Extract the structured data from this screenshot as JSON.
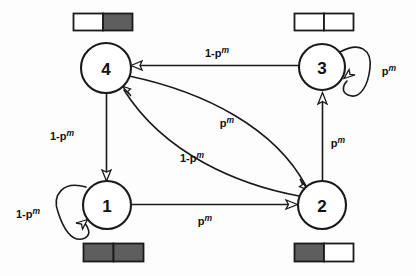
{
  "figure": {
    "background_color": "#fdfdfd",
    "ink_color": "#1a1a1a",
    "cell_fill_dark": "#5e5e5e",
    "cell_fill_light": "#ffffff"
  },
  "nodes": [
    {
      "id": "node-4",
      "label": "4",
      "cx": 106,
      "cy": 68,
      "r": 25
    },
    {
      "id": "node-3",
      "label": "3",
      "cx": 322,
      "cy": 67,
      "r": 23
    },
    {
      "id": "node-1",
      "label": "1",
      "cx": 107,
      "cy": 205,
      "r": 24
    },
    {
      "id": "node-2",
      "label": "2",
      "cx": 322,
      "cy": 205,
      "r": 24
    }
  ],
  "registers": [
    {
      "id": "register-node-4",
      "owner": "4",
      "position": "above",
      "x": 73,
      "y": 13,
      "w": 59,
      "h": 18,
      "cells": [
        "white",
        "dark"
      ]
    },
    {
      "id": "register-node-3",
      "owner": "3",
      "position": "above",
      "x": 294,
      "y": 13,
      "w": 59,
      "h": 18,
      "cells": [
        "white",
        "white"
      ]
    },
    {
      "id": "register-node-1",
      "owner": "1",
      "position": "below",
      "x": 83,
      "y": 243,
      "w": 60,
      "h": 19,
      "cells": [
        "dark",
        "dark"
      ]
    },
    {
      "id": "register-node-2",
      "owner": "2",
      "position": "below",
      "x": 294,
      "y": 243,
      "w": 59,
      "h": 19,
      "cells": [
        "dark",
        "white"
      ]
    }
  ],
  "edges": [
    {
      "id": "edge-3-to-4",
      "from": "3",
      "to": "4",
      "label_base": "1-p",
      "label_sup": "m",
      "label_x": 217,
      "label_y": 57,
      "kind": "straight"
    },
    {
      "id": "edge-4-to-2",
      "from": "4",
      "to": "2",
      "label_base": "p",
      "label_sup": "m",
      "label_x": 227,
      "label_y": 127,
      "kind": "curve"
    },
    {
      "id": "edge-2-to-4",
      "from": "2",
      "to": "4",
      "label_base": "1-p",
      "label_sup": "m",
      "label_x": 192,
      "label_y": 162,
      "kind": "curve"
    },
    {
      "id": "edge-4-to-1",
      "from": "4",
      "to": "1",
      "label_base": "1-p",
      "label_sup": "m",
      "label_x": 62,
      "label_y": 140,
      "kind": "straight"
    },
    {
      "id": "edge-1-to-2",
      "from": "1",
      "to": "2",
      "label_base": "p",
      "label_sup": "m",
      "label_x": 205,
      "label_y": 225,
      "kind": "straight"
    },
    {
      "id": "edge-2-to-3",
      "from": "2",
      "to": "3",
      "label_base": "p",
      "label_sup": "m",
      "label_x": 338,
      "label_y": 147,
      "kind": "straight"
    },
    {
      "id": "edge-1-self-loop",
      "from": "1",
      "to": "1",
      "label_base": "1-p",
      "label_sup": "m",
      "label_x": 28,
      "label_y": 218,
      "kind": "self-loop"
    },
    {
      "id": "edge-3-self-loop",
      "from": "3",
      "to": "3",
      "label_base": "p",
      "label_sup": "m",
      "label_x": 389,
      "label_y": 75,
      "kind": "self-loop"
    }
  ]
}
